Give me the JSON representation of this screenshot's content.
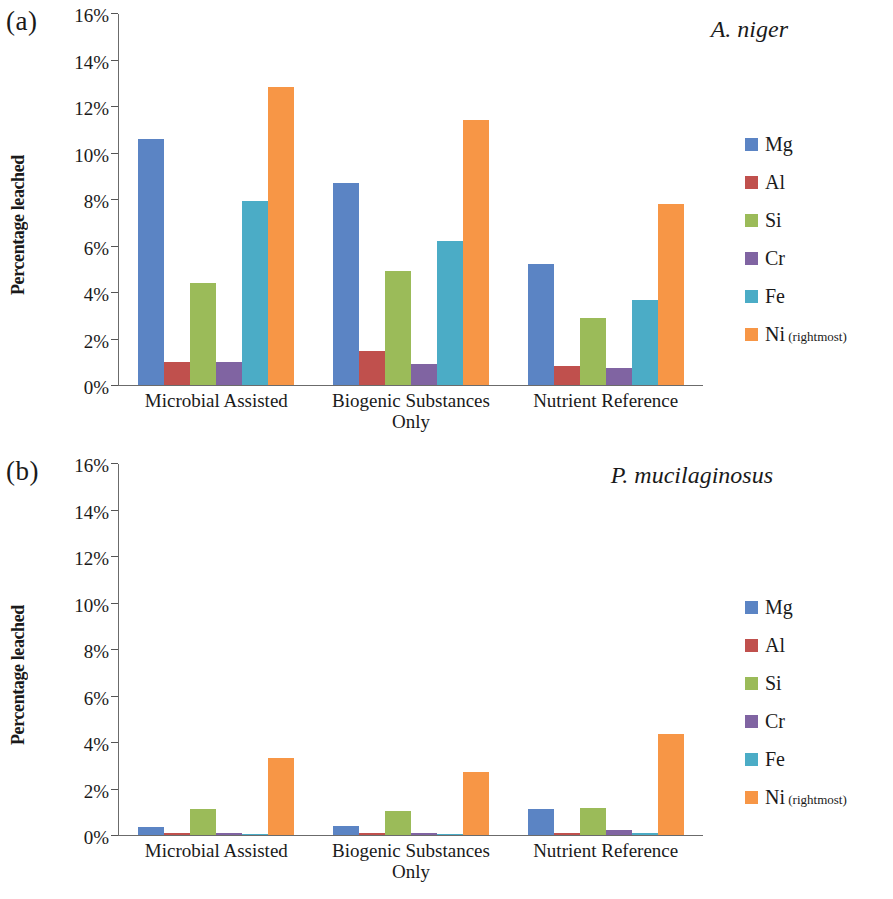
{
  "figure": {
    "panels": [
      {
        "label": "(a)",
        "species": "A. niger",
        "axis_title": "Percentage leached",
        "chart_ref": 0
      },
      {
        "label": "(b)",
        "species": "P. mucilaginosus",
        "axis_title": "Percentage leached",
        "chart_ref": 1
      }
    ],
    "legend_suffix": " (rightmost)"
  },
  "colors": {
    "Mg": "#5b84c4",
    "Al": "#c0504d",
    "Si": "#9bbb59",
    "Cr": "#8064a2",
    "Fe": "#4bacc6",
    "Ni": "#f79646",
    "axis": "#6b6b6b",
    "text": "#1a1a1a"
  },
  "chart_data": [
    {
      "type": "bar",
      "title": "A. niger",
      "xlabel": "",
      "ylabel": "Percentage leached",
      "ylim": [
        0,
        16
      ],
      "ytick_labels": [
        "16%",
        "14%",
        "12%",
        "10%",
        "8%",
        "6%",
        "4%",
        "2%",
        "0%"
      ],
      "ytick_values": [
        16,
        14,
        12,
        10,
        8,
        6,
        4,
        2,
        0
      ],
      "grid": false,
      "legend_position": "right",
      "categories": [
        "Microbial Assisted",
        "Biogenic Substances Only",
        "Nutrient Reference"
      ],
      "series": [
        {
          "name": "Mg",
          "values": [
            10.6,
            8.7,
            5.2
          ]
        },
        {
          "name": "Al",
          "values": [
            1.0,
            1.45,
            0.8
          ]
        },
        {
          "name": "Si",
          "values": [
            4.4,
            4.9,
            2.9
          ]
        },
        {
          "name": "Cr",
          "values": [
            1.0,
            0.9,
            0.75
          ]
        },
        {
          "name": "Fe",
          "values": [
            7.9,
            6.2,
            3.65
          ]
        },
        {
          "name": "Ni",
          "values": [
            12.8,
            11.4,
            7.8
          ]
        }
      ]
    },
    {
      "type": "bar",
      "title": "P. mucilaginosus",
      "xlabel": "",
      "ylabel": "Percentage leached",
      "ylim": [
        0,
        16
      ],
      "ytick_labels": [
        "16%",
        "14%",
        "12%",
        "10%",
        "8%",
        "6%",
        "4%",
        "2%",
        "0%"
      ],
      "ytick_values": [
        16,
        14,
        12,
        10,
        8,
        6,
        4,
        2,
        0
      ],
      "grid": false,
      "legend_position": "right",
      "categories": [
        "Microbial Assisted",
        "Biogenic Substances Only",
        "Nutrient Reference"
      ],
      "series": [
        {
          "name": "Mg",
          "values": [
            0.35,
            0.4,
            1.1
          ]
        },
        {
          "name": "Al",
          "values": [
            0.1,
            0.08,
            0.1
          ]
        },
        {
          "name": "Si",
          "values": [
            1.1,
            1.05,
            1.15
          ]
        },
        {
          "name": "Cr",
          "values": [
            0.1,
            0.1,
            0.2
          ]
        },
        {
          "name": "Fe",
          "values": [
            0.06,
            0.05,
            0.08
          ]
        },
        {
          "name": "Ni",
          "values": [
            3.3,
            2.7,
            4.35
          ]
        }
      ]
    }
  ]
}
